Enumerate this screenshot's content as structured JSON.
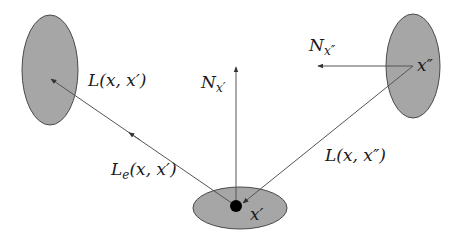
{
  "diagram": {
    "type": "rendering-equation-geometry",
    "colors": {
      "surface_fill": "#a6a6a6",
      "surface_stroke": "#4a4a4a",
      "line": "#555555",
      "point": "#000000",
      "text": "#1a1a1a"
    },
    "surfaces": [
      {
        "id": "left-surface",
        "cx": 50,
        "cy": 70,
        "rx": 28,
        "ry": 55
      },
      {
        "id": "right-surface",
        "cx": 413,
        "cy": 66,
        "rx": 27,
        "ry": 52
      },
      {
        "id": "bottom-surface",
        "cx": 240,
        "cy": 208,
        "rx": 47,
        "ry": 21
      }
    ],
    "point": {
      "id": "x-prime-point",
      "cx": 236,
      "cy": 206,
      "r": 6
    },
    "labels": {
      "l_x_xprime": {
        "base": "L",
        "args": "(x, x′)"
      },
      "n_xprime": {
        "base": "N",
        "sub": "x′"
      },
      "n_xdoubleprime": {
        "base": "N",
        "sub": "x″"
      },
      "x_doubleprime": "x″",
      "l_x_xdoubleprime": {
        "base": "L",
        "args": "(x, x″)"
      },
      "le_x_xprime": {
        "base": "L",
        "sub": "e",
        "args": "(x, x′)"
      },
      "x_prime": "x′"
    }
  }
}
